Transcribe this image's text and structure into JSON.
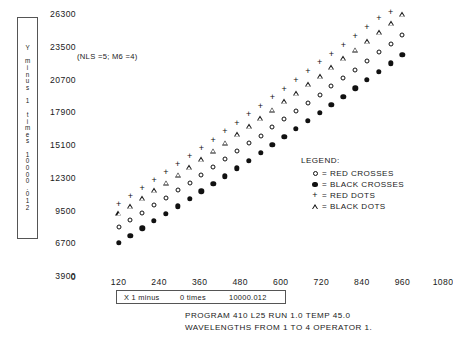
{
  "annotation": "(NLS =5; M6 =4)",
  "y_axis_caption": {
    "line1": "Y",
    "line2": "minus",
    "line3": "1",
    "line4": "times",
    "line5": "10000.012"
  },
  "x_axis_caption": {
    "part1": "X 1 minus",
    "part2": "0 times",
    "part3": "10000.012"
  },
  "legend": {
    "title": "LEGEND:",
    "items": [
      {
        "symbol": "open-circle",
        "text": "= RED CROSSES"
      },
      {
        "symbol": "filled-circle",
        "text": "= BLACK CROSSES"
      },
      {
        "symbol": "plus",
        "text": "= RED DOTS"
      },
      {
        "symbol": "triangle",
        "text": "= BLACK DOTS"
      }
    ]
  },
  "footer": {
    "line1": "PROGRAM 410 L25 RUN 1.0 TEMP 45.0",
    "line2": "WAVELENGTHS FROM 1 TO 4 OPERATOR 1."
  },
  "chart_data": {
    "type": "scatter",
    "title": "",
    "xlabel": "X 1 minus 0 times 10000.012",
    "ylabel": "Y minus 1 times 10000.012",
    "xlim": [
      0,
      1080
    ],
    "ylim": [
      3900,
      26300
    ],
    "grid": false,
    "legend_position": "center-right",
    "xticks": [
      0,
      120,
      240,
      360,
      480,
      600,
      720,
      840,
      960,
      1080
    ],
    "yticks": [
      3900,
      6700,
      9500,
      12300,
      15100,
      17900,
      20700,
      23500,
      26300
    ],
    "series": [
      {
        "name": "RED DOTS",
        "marker": "plus",
        "color": "#111111",
        "x": [
          120,
          155,
          190,
          225,
          260,
          295,
          330,
          365,
          400,
          435,
          470,
          505,
          540,
          575,
          610,
          645,
          680,
          715,
          750,
          785,
          820,
          855,
          890,
          925,
          960
        ],
        "y": [
          10050,
          10720,
          11400,
          12080,
          12770,
          13460,
          14160,
          14860,
          15570,
          16280,
          17000,
          17720,
          18450,
          19180,
          19920,
          20660,
          21410,
          22160,
          22920,
          23680,
          24450,
          25220,
          26000,
          26500,
          26900
        ]
      },
      {
        "name": "BLACK DOTS",
        "marker": "triangle",
        "color": "#111111",
        "x": [
          120,
          155,
          190,
          225,
          260,
          295,
          330,
          365,
          400,
          435,
          470,
          505,
          540,
          575,
          610,
          645,
          680,
          715,
          750,
          785,
          820,
          855,
          890,
          925,
          960
        ],
        "y": [
          9250,
          9900,
          10560,
          11220,
          11890,
          12560,
          13240,
          13920,
          14610,
          15300,
          16000,
          16700,
          17410,
          18120,
          18840,
          19560,
          20290,
          21020,
          21760,
          22500,
          23250,
          24000,
          24760,
          25520,
          26290
        ]
      },
      {
        "name": "RED CROSSES",
        "marker": "open-circle",
        "color": "#111111",
        "x": [
          120,
          155,
          190,
          225,
          260,
          295,
          330,
          365,
          400,
          435,
          470,
          505,
          540,
          575,
          610,
          645,
          680,
          715,
          750,
          785,
          820,
          855,
          890,
          925,
          960
        ],
        "y": [
          8050,
          8680,
          9310,
          9950,
          10590,
          11240,
          11890,
          12550,
          13210,
          13880,
          14550,
          15230,
          15910,
          16600,
          17290,
          17990,
          18690,
          19400,
          20110,
          20830,
          21550,
          22280,
          23010,
          23750,
          24490
        ]
      },
      {
        "name": "BLACK CROSSES",
        "marker": "filled-circle",
        "color": "#111111",
        "x": [
          120,
          155,
          190,
          225,
          260,
          295,
          330,
          365,
          400,
          435,
          470,
          505,
          540,
          575,
          610,
          645,
          680,
          715,
          750,
          785,
          820,
          855,
          890,
          925,
          960
        ],
        "y": [
          6750,
          7360,
          7980,
          8600,
          9230,
          9860,
          10500,
          11140,
          11790,
          12440,
          13100,
          13760,
          14430,
          15100,
          15780,
          16460,
          17150,
          17840,
          18540,
          19240,
          19950,
          20660,
          21380,
          22100,
          22830
        ]
      }
    ]
  }
}
